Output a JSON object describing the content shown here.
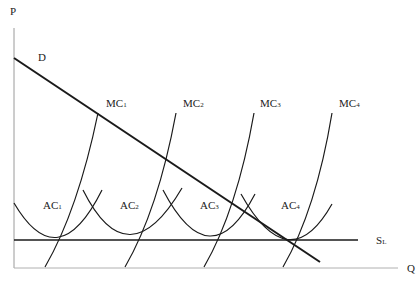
{
  "diagram": {
    "type": "economics-cost-curves",
    "axes": {
      "y_label": "P",
      "x_label": "Q"
    },
    "demand": {
      "label": "D"
    },
    "supply": {
      "label": "S",
      "subscript": "L"
    },
    "mc_curves": [
      {
        "label": "MC",
        "subscript": "1"
      },
      {
        "label": "MC",
        "subscript": "2"
      },
      {
        "label": "MC",
        "subscript": "3"
      },
      {
        "label": "MC",
        "subscript": "4"
      }
    ],
    "ac_curves": [
      {
        "label": "AC",
        "subscript": "1"
      },
      {
        "label": "AC",
        "subscript": "2"
      },
      {
        "label": "AC",
        "subscript": "3"
      },
      {
        "label": "AC",
        "subscript": "4"
      }
    ],
    "colors": {
      "line": "#1a1a1a",
      "axis": "#9a9a9a"
    }
  }
}
